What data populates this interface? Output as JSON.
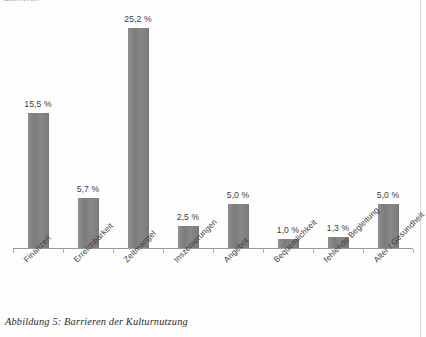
{
  "document": {
    "clipped_header_text": "Barrieren",
    "caption": "Abbildung 5: Barrieren der Kulturnutzung"
  },
  "chart_data": {
    "type": "bar",
    "title": "",
    "subtitle": "",
    "xlabel": "",
    "ylabel": "",
    "grid": false,
    "legend": false,
    "axis_visible": {
      "x": true,
      "y": false
    },
    "ylim": [
      0,
      25.2
    ],
    "value_suffix": " %",
    "decimal_separator": ",",
    "categories": [
      "Finanzen",
      "Erreichbarkeit",
      "Zeitmangel",
      "Inszenierungen",
      "Angebot",
      "Bequemlichkeit",
      "fehlende Begleitung",
      "Alter / Gesundheit"
    ],
    "values": [
      15.5,
      5.7,
      25.2,
      2.5,
      5.0,
      1.0,
      1.3,
      5.0
    ],
    "data_labels": [
      "15,5 %",
      "5,7 %",
      "25,2 %",
      "2,5 %",
      "5,0 %",
      "1,0 %",
      "1,3 %",
      "5,0 %"
    ],
    "colors": {
      "bar": "#808080",
      "axis": "#9a9a9a",
      "label_text": "#3c3c3c",
      "category_text": "#3e3e3e",
      "background": "#fdfdfd"
    }
  }
}
